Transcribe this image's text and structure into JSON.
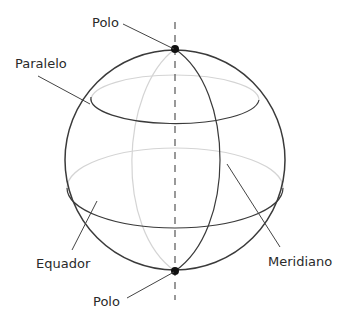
{
  "diagram": {
    "type": "globe-coordinate-lines",
    "labels": {
      "pole_top": "Polo",
      "parallel": "Paralelo",
      "equator": "Equador",
      "pole_bottom": "Polo",
      "meridian": "Meridiano"
    },
    "colors": {
      "outline": "#3a3a3a",
      "hidden_line": "#d0d0d0",
      "axis": "#555555",
      "pole_dot": "#111111",
      "text": "#2a2a2a"
    }
  }
}
